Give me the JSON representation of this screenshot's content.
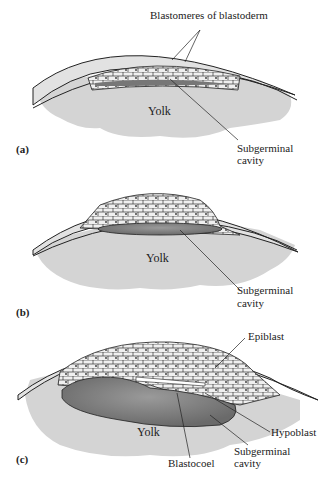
{
  "figure": {
    "panels": [
      {
        "id": "a",
        "label": "(a)",
        "labels": {
          "top": "Blastomeres of blastoderm",
          "yolk": "Yolk",
          "cavity_line1": "Subgerminal",
          "cavity_line2": "cavity"
        }
      },
      {
        "id": "b",
        "label": "(b)",
        "labels": {
          "yolk": "Yolk",
          "cavity_line1": "Subgerminal",
          "cavity_line2": "cavity"
        }
      },
      {
        "id": "c",
        "label": "(c)",
        "labels": {
          "epiblast": "Epiblast",
          "hypoblast": "Hypoblast",
          "yolk": "Yolk",
          "blastocoel": "Blastocoel",
          "cavity_line1": "Subgerminal",
          "cavity_line2": "cavity"
        }
      }
    ],
    "colors": {
      "yolk": "#d4d4d4",
      "albumen": "#e6e6e6",
      "cavity": "#8a8a8a",
      "line": "#222222"
    }
  }
}
